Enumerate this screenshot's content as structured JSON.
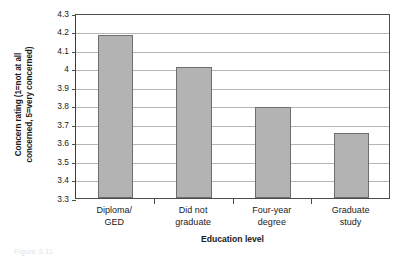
{
  "chart_data": {
    "type": "bar",
    "title": "",
    "categories": [
      "Diploma/ GED",
      "Did not graduate",
      "Four-year degree",
      "Graduate study"
    ],
    "category_lines": [
      [
        "Diploma/",
        "GED"
      ],
      [
        "Did not",
        "graduate"
      ],
      [
        "Four-year",
        "degree"
      ],
      [
        "Graduate",
        "study"
      ]
    ],
    "values": [
      4.18,
      4.01,
      3.79,
      3.65
    ],
    "xlabel": "Education level",
    "ylabel": "Concern rating (1=not at all concerned, 5=very concerned)",
    "ylabel_lines": [
      "Concern rating (1=not at all",
      "concerned, 5=very concerned)"
    ],
    "ylim": [
      3.3,
      4.3
    ],
    "ytick_values": [
      4.3,
      4.2,
      4.1,
      4,
      3.9,
      3.8,
      3.7,
      3.6,
      3.5,
      3.4,
      3.3
    ],
    "ytick_labels": [
      "4.3",
      "4.2",
      "4.1",
      "4",
      "3.9",
      "3.8",
      "3.7",
      "3.6",
      "3.5",
      "3.4",
      "3.3"
    ],
    "grid": true,
    "legend": false,
    "legend_position": "none",
    "bar_color": "#b3b3b3",
    "bar_border_color": "#6e6e6e",
    "gridline_color": "#b5b5b5",
    "axis_color": "#4d4d4d"
  },
  "caption_artifact": "Figure 3.11"
}
